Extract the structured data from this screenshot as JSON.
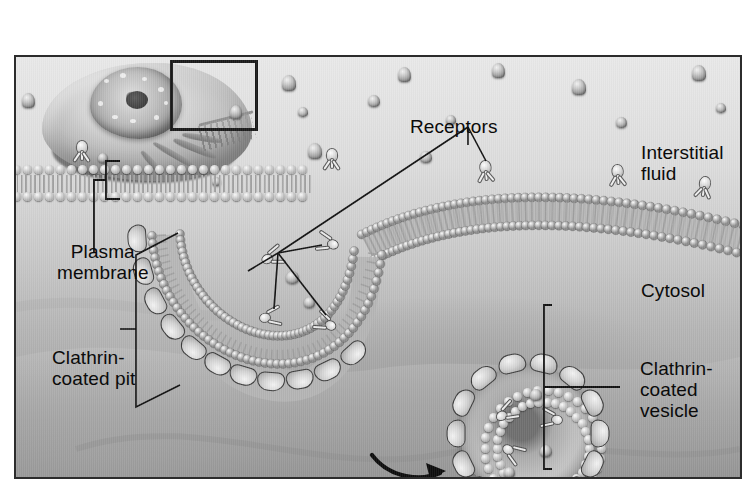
{
  "figure": {
    "kind": "biology-illustration",
    "palette": {
      "ink": "#0b0b0b",
      "border": "#2c2c2c",
      "membrane_head": "#cfcfcf",
      "background_light": "#e9e9e9",
      "background_dark": "#9a9a9a"
    }
  },
  "labels": {
    "receptors": "Receptors",
    "interstitial_fluid": "Interstitial\nfluid",
    "cytosol": "Cytosol",
    "plasma_membrane": "Plasma\nmembrane",
    "clathrin_coated_pit": "Clathrin-\ncoated pit",
    "clathrin_coated_vesicle": "Clathrin-\ncoated\nvesicle"
  },
  "structures": {
    "cell_overview": "whole-cell overview with nucleus and nucleolus",
    "inset_box": "magnified region indicator",
    "plasma_membrane": "phospholipid bilayer",
    "clathrin_coated_pit": "invaginating membrane pit coated with clathrin lobes",
    "clathrin_coated_vesicle": "detached spherical vesicle with clathrin coat",
    "receptors": "Y-shaped membrane receptor proteins",
    "ligands": "extracellular ligand particles",
    "process_arrow": "curved arrow showing vesicle budding direction"
  },
  "counts": {
    "surface_receptors": 5,
    "internal_receptors": 6,
    "ligand_particles": 18
  }
}
